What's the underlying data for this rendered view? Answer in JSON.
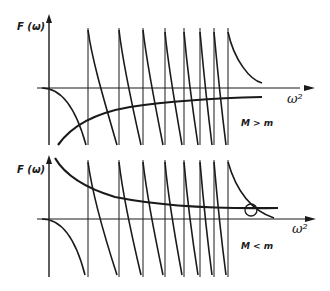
{
  "figure": {
    "panels": [
      {
        "id": "top",
        "y_label": "F (ω)",
        "x_label": "ω²",
        "condition": "M > m",
        "asymptotes_x": [
          88,
          119,
          143,
          165,
          184,
          200,
          214,
          228
        ]
      },
      {
        "id": "bottom",
        "y_label": "F (ω)",
        "x_label": "ω²",
        "condition": "M < m",
        "asymptotes_x": [
          88,
          119,
          143,
          165,
          184,
          200,
          214,
          228
        ],
        "intersection_marker": "circle"
      }
    ],
    "colors": {
      "ink": "#1a1a1a",
      "background": "#ffffff"
    }
  }
}
